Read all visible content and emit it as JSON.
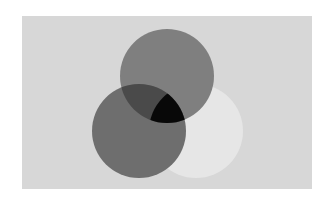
{
  "canvas": {
    "width": 332,
    "height": 202,
    "page_background": "#ffffff"
  },
  "panel": {
    "x": 22,
    "y": 16,
    "width": 290,
    "height": 173,
    "fill": "#d7d7d7"
  },
  "circles": [
    {
      "id": "top",
      "cx": 167,
      "cy": 76,
      "r": 47,
      "fill": "#7f7f7f"
    },
    {
      "id": "bottom-left",
      "cx": 139,
      "cy": 131,
      "r": 47,
      "fill": "#6e6e6e"
    },
    {
      "id": "bottom-right",
      "cx": 196,
      "cy": 131,
      "r": 47,
      "fill": "#e6e6e6"
    }
  ],
  "overlaps": {
    "top_and_bottom_left": "#4a4a4a",
    "all_three": "#080808"
  }
}
